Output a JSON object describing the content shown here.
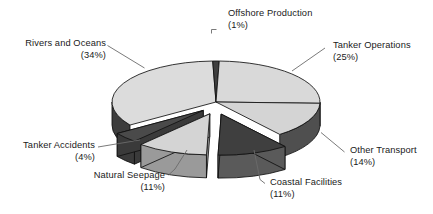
{
  "chart_data": {
    "type": "pie",
    "title": "",
    "subtitle": "",
    "xlabel": "",
    "ylabel": "",
    "legend_position": "none",
    "grid": false,
    "style": "3d-exploded-pie",
    "units": "percent",
    "categories": [
      "Offshore Production",
      "Tanker Operations",
      "Other Transport",
      "Coastal Facilities",
      "Natural Seepage",
      "Tanker Accidents",
      "Rivers and Oceans"
    ],
    "values": [
      1,
      25,
      14,
      11,
      11,
      4,
      34
    ],
    "slices": [
      {
        "name": "Offshore Production",
        "label": "Offshore Production",
        "value": 1,
        "percent_text": "(1%)",
        "tone": "dark",
        "top_color": "#3f3f3f",
        "side_color": "#262626",
        "exploded": false,
        "start_deg": -91.8,
        "end_deg": -88.2
      },
      {
        "name": "Tanker Operations",
        "label": "Tanker Operations",
        "value": 25,
        "percent_text": "(25%)",
        "tone": "light",
        "top_color": "#d9d9d9",
        "side_color": "#4f4f4f",
        "exploded": false,
        "start_deg": -88.2,
        "end_deg": 1.8
      },
      {
        "name": "Other Transport",
        "label": "Other Transport",
        "value": 14,
        "percent_text": "(14%)",
        "tone": "light",
        "top_color": "#d4d4d4",
        "side_color": "#4f4f4f",
        "exploded": false,
        "start_deg": 1.8,
        "end_deg": 52.2
      },
      {
        "name": "Coastal Facilities",
        "label": "Coastal Facilities",
        "value": 11,
        "percent_text": "(11%)",
        "tone": "dark",
        "top_color": "#3f3f3f",
        "side_color": "#5a5a5a",
        "exploded": true,
        "start_deg": 52.2,
        "end_deg": 91.8
      },
      {
        "name": "Natural Seepage",
        "label": "Natural Seepage",
        "value": 11,
        "percent_text": "(11%)",
        "tone": "light",
        "top_color": "#d4d4d4",
        "side_color": "#9a9a9a",
        "exploded": true,
        "start_deg": 91.8,
        "end_deg": 131.4
      },
      {
        "name": "Tanker Accidents",
        "label": "Tanker Accidents",
        "value": 4,
        "percent_text": "(4%)",
        "tone": "dark",
        "top_color": "#4a4a4a",
        "side_color": "#3a3a3a",
        "exploded": true,
        "start_deg": 131.4,
        "end_deg": 145.8
      },
      {
        "name": "Rivers and Oceans",
        "label": "Rivers and Oceans",
        "value": 34,
        "percent_text": "(34%)",
        "tone": "light",
        "top_color": "#dcdcdc",
        "side_color": "#3d3d3d",
        "exploded": false,
        "start_deg": 145.8,
        "end_deg": 268.2
      }
    ],
    "colors": {
      "light_top": "#d9d9d9",
      "dark_top": "#3f3f3f",
      "side_light": "#4f4f4f",
      "side_dark": "#2a2a2a",
      "outline": "#111111",
      "background": "#ffffff",
      "text": "#1a1a1a",
      "leader_line": "#6b6b6b"
    }
  },
  "labels": {
    "offshore_production": {
      "name": "Offshore Production",
      "percent": "(1%)"
    },
    "tanker_operations": {
      "name": "Tanker Operations",
      "percent": "(25%)"
    },
    "other_transport": {
      "name": "Other Transport",
      "percent": "(14%)"
    },
    "coastal_facilities": {
      "name": "Coastal Facilities",
      "percent": "(11%)"
    },
    "natural_seepage": {
      "name": "Natural Seepage",
      "percent": "(11%)"
    },
    "tanker_accidents": {
      "name": "Tanker Accidents",
      "percent": "(4%)"
    },
    "rivers_and_oceans": {
      "name": "Rivers and Oceans",
      "percent": "(34%)"
    }
  }
}
